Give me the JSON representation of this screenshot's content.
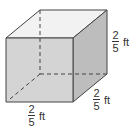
{
  "diagram": {
    "shape": "cube",
    "labels": {
      "height": {
        "numerator": "2",
        "denominator": "5",
        "unit": "ft"
      },
      "depth": {
        "numerator": "2",
        "denominator": "5",
        "unit": "ft"
      },
      "width": {
        "numerator": "2",
        "denominator": "5",
        "unit": "ft"
      }
    },
    "colors": {
      "front": "#d4d4d4",
      "top": "#f2f2f2",
      "side": "#bdbdbd",
      "edge": "#444444"
    }
  }
}
